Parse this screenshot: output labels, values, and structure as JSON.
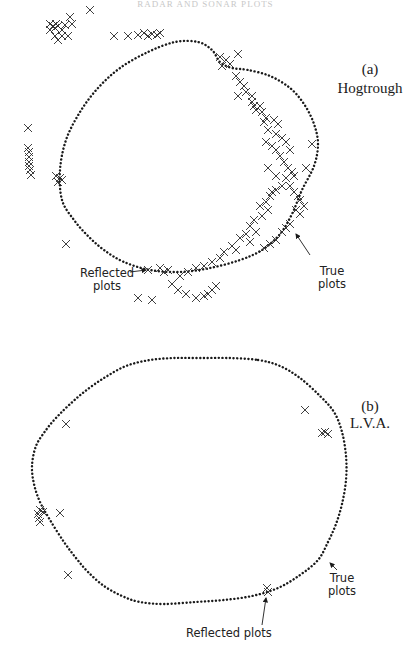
{
  "header": {
    "text": "RADAR AND SONAR PLOTS"
  },
  "colors": {
    "ink": "#1a1a1a",
    "background": "#ffffff"
  },
  "panels": [
    {
      "id": "a",
      "tag": "(a)",
      "title": "Hogtrough",
      "true_label": [
        "True",
        "plots"
      ],
      "reflected_label": [
        "Reflected",
        "plots"
      ],
      "outline": [
        [
          62,
          200
        ],
        [
          60,
          170
        ],
        [
          66,
          140
        ],
        [
          80,
          112
        ],
        [
          98,
          88
        ],
        [
          120,
          68
        ],
        [
          148,
          52
        ],
        [
          175,
          42
        ],
        [
          198,
          42
        ],
        [
          212,
          50
        ],
        [
          220,
          62
        ],
        [
          232,
          68
        ],
        [
          248,
          70
        ],
        [
          270,
          76
        ],
        [
          290,
          88
        ],
        [
          304,
          104
        ],
        [
          314,
          124
        ],
        [
          318,
          144
        ],
        [
          314,
          166
        ],
        [
          302,
          190
        ],
        [
          292,
          214
        ],
        [
          280,
          234
        ],
        [
          262,
          250
        ],
        [
          240,
          260
        ],
        [
          210,
          268
        ],
        [
          180,
          272
        ],
        [
          150,
          270
        ],
        [
          124,
          262
        ],
        [
          104,
          250
        ],
        [
          88,
          236
        ],
        [
          74,
          220
        ],
        [
          62,
          200
        ]
      ],
      "crosses": [
        [
          90,
          10
        ],
        [
          70,
          17
        ],
        [
          56,
          24
        ],
        [
          53,
          26
        ],
        [
          50,
          24
        ],
        [
          55,
          28
        ],
        [
          50,
          30
        ],
        [
          62,
          30
        ],
        [
          58,
          26
        ],
        [
          65,
          25
        ],
        [
          72,
          24
        ],
        [
          114,
          36
        ],
        [
          128,
          36
        ],
        [
          138,
          35
        ],
        [
          144,
          33
        ],
        [
          148,
          36
        ],
        [
          152,
          34
        ],
        [
          157,
          35
        ],
        [
          160,
          33
        ],
        [
          55,
          36
        ],
        [
          62,
          36
        ],
        [
          68,
          36
        ],
        [
          58,
          40
        ],
        [
          28,
          128
        ],
        [
          28,
          148
        ],
        [
          29,
          152
        ],
        [
          29,
          157
        ],
        [
          29,
          162
        ],
        [
          29,
          166
        ],
        [
          30,
          170
        ],
        [
          31,
          175
        ],
        [
          56,
          176
        ],
        [
          60,
          178
        ],
        [
          62,
          180
        ],
        [
          58,
          182
        ],
        [
          66,
          244
        ],
        [
          220,
          57
        ],
        [
          226,
          60
        ],
        [
          230,
          64
        ],
        [
          238,
          54
        ],
        [
          222,
          66
        ],
        [
          236,
          76
        ],
        [
          240,
          82
        ],
        [
          244,
          86
        ],
        [
          246,
          92
        ],
        [
          252,
          96
        ],
        [
          238,
          96
        ],
        [
          254,
          106
        ],
        [
          260,
          106
        ],
        [
          262,
          112
        ],
        [
          266,
          118
        ],
        [
          274,
          120
        ],
        [
          278,
          124
        ],
        [
          268,
          130
        ],
        [
          276,
          134
        ],
        [
          282,
          138
        ],
        [
          286,
          142
        ],
        [
          290,
          150
        ],
        [
          252,
          102
        ],
        [
          256,
          110
        ],
        [
          264,
          122
        ],
        [
          266,
          142
        ],
        [
          272,
          146
        ],
        [
          276,
          150
        ],
        [
          280,
          156
        ],
        [
          284,
          162
        ],
        [
          288,
          168
        ],
        [
          292,
          172
        ],
        [
          294,
          176
        ],
        [
          286,
          178
        ],
        [
          290,
          186
        ],
        [
          294,
          192
        ],
        [
          298,
          196
        ],
        [
          300,
          200
        ],
        [
          304,
          206
        ],
        [
          296,
          210
        ],
        [
          300,
          214
        ],
        [
          306,
          168
        ],
        [
          312,
          144
        ],
        [
          268,
          168
        ],
        [
          276,
          176
        ],
        [
          282,
          186
        ],
        [
          260,
          206
        ],
        [
          266,
          202
        ],
        [
          270,
          196
        ],
        [
          272,
          192
        ],
        [
          276,
          190
        ],
        [
          254,
          220
        ],
        [
          250,
          226
        ],
        [
          262,
          216
        ],
        [
          268,
          210
        ],
        [
          246,
          234
        ],
        [
          256,
          232
        ],
        [
          240,
          238
        ],
        [
          250,
          242
        ],
        [
          232,
          246
        ],
        [
          224,
          252
        ],
        [
          236,
          250
        ],
        [
          220,
          258
        ],
        [
          212,
          262
        ],
        [
          204,
          266
        ],
        [
          196,
          268
        ],
        [
          188,
          272
        ],
        [
          180,
          276
        ],
        [
          172,
          284
        ],
        [
          178,
          290
        ],
        [
          186,
          294
        ],
        [
          196,
          298
        ],
        [
          204,
          296
        ],
        [
          208,
          294
        ],
        [
          212,
          290
        ],
        [
          216,
          286
        ],
        [
          148,
          270
        ],
        [
          160,
          268
        ],
        [
          164,
          272
        ],
        [
          168,
          270
        ],
        [
          138,
          298
        ],
        [
          152,
          300
        ],
        [
          264,
          248
        ],
        [
          270,
          244
        ],
        [
          276,
          240
        ],
        [
          282,
          232
        ],
        [
          286,
          228
        ],
        [
          290,
          224
        ]
      ],
      "tag_pos": [
        370,
        70
      ],
      "title_pos": [
        370,
        89
      ],
      "true_pos": [
        318,
        265
      ],
      "reflected_pos": [
        110,
        275
      ],
      "arrows": [
        [
          [
            130,
            272
          ],
          [
            146,
            270
          ]
        ],
        [
          [
            310,
            255
          ],
          [
            296,
            234
          ]
        ]
      ]
    },
    {
      "id": "b",
      "tag": "(b)",
      "title": "L.V.A.",
      "true_label": [
        "True",
        "plots"
      ],
      "reflected_label": [
        "Reflected",
        "plots"
      ],
      "outline": [
        [
          258,
          360
        ],
        [
          280,
          366
        ],
        [
          300,
          378
        ],
        [
          320,
          396
        ],
        [
          334,
          412
        ],
        [
          342,
          432
        ],
        [
          346,
          456
        ],
        [
          346,
          480
        ],
        [
          342,
          504
        ],
        [
          336,
          524
        ],
        [
          328,
          542
        ],
        [
          318,
          560
        ],
        [
          300,
          575
        ],
        [
          278,
          588
        ],
        [
          252,
          596
        ],
        [
          224,
          600
        ],
        [
          196,
          602
        ],
        [
          164,
          604
        ],
        [
          140,
          602
        ],
        [
          122,
          596
        ],
        [
          104,
          586
        ],
        [
          88,
          572
        ],
        [
          76,
          558
        ],
        [
          64,
          542
        ],
        [
          50,
          520
        ],
        [
          40,
          502
        ],
        [
          34,
          484
        ],
        [
          32,
          466
        ],
        [
          36,
          446
        ],
        [
          46,
          430
        ],
        [
          56,
          418
        ],
        [
          68,
          406
        ],
        [
          84,
          392
        ],
        [
          104,
          378
        ],
        [
          126,
          366
        ],
        [
          150,
          360
        ],
        [
          175,
          358
        ],
        [
          200,
          358
        ],
        [
          228,
          358
        ],
        [
          258,
          360
        ]
      ],
      "crosses": [
        [
          66,
          424
        ],
        [
          40,
          510
        ],
        [
          38,
          514
        ],
        [
          43,
          512
        ],
        [
          39,
          518
        ],
        [
          40,
          522
        ],
        [
          60,
          513
        ],
        [
          68,
          575
        ],
        [
          305,
          410
        ],
        [
          325,
          432
        ],
        [
          328,
          434
        ],
        [
          322,
          433
        ],
        [
          267,
          588
        ],
        [
          268,
          592
        ]
      ],
      "tag_pos": [
        370,
        407
      ],
      "title_pos": [
        370,
        424
      ],
      "true_pos": [
        328,
        572
      ],
      "reflected_pos": [
        206,
        635
      ],
      "arrows": [
        [
          [
            262,
            625
          ],
          [
            266,
            598
          ]
        ],
        [
          [
            337,
            570
          ],
          [
            330,
            563
          ]
        ]
      ]
    }
  ]
}
